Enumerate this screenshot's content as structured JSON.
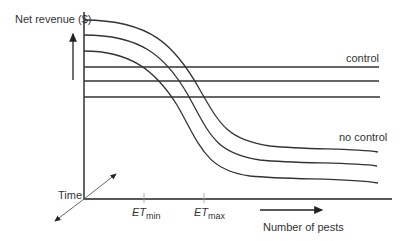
{
  "diagram": {
    "y_axis_label": "Net revenue ($)",
    "x_axis_label": "Number of pests",
    "z_axis_label": "Time",
    "series_labels": {
      "control": "control",
      "no_control": "no control"
    },
    "thresholds": [
      {
        "name": "ET",
        "subscript": "min"
      },
      {
        "name": "ET",
        "subscript": "max"
      }
    ],
    "line_color": "#333333"
  }
}
